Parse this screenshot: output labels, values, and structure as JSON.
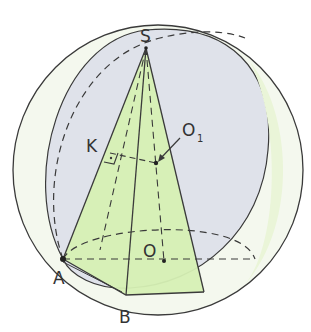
{
  "figure": {
    "type": "geometry-diagram",
    "colors": {
      "sphere_fill": "#dfe2ea",
      "cone_fill": "#d6f0b4",
      "light_green": "#eef6e0",
      "stroke": "#3a3a3a",
      "background": "#ffffff"
    }
  },
  "labels": {
    "S": "S",
    "K": "K",
    "O1_main": "O",
    "O1_sub": "1",
    "O": "O",
    "A": "A",
    "B": "B"
  },
  "points": {
    "S": [
      146,
      48
    ],
    "K": [
      110,
      153
    ],
    "O1": [
      156,
      163
    ],
    "O": [
      164,
      261
    ],
    "A": [
      63,
      259
    ],
    "B": [
      126,
      295
    ]
  }
}
